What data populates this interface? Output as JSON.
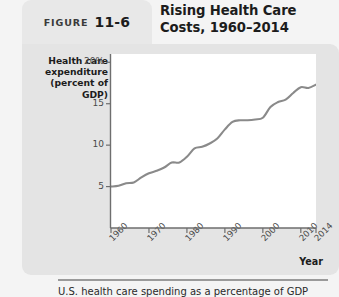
{
  "figure": {
    "label_word": "FIGURE",
    "number": "11-6",
    "title": "Rising Health Care Costs, 1960–2014",
    "caption": "U.S. health care spending as a percentage of GDP"
  },
  "colors": {
    "panel": "#e4e4e4",
    "tab": "#e8e8e8",
    "plot_background": "#ffffff",
    "line": "#8a8a8a",
    "axis": "#6e6e6e",
    "text": "#1c1c1c"
  },
  "chart_data": {
    "type": "line",
    "title": "Rising Health Care Costs, 1960–2014",
    "xlabel": "Year",
    "ylabel": "Health care expenditure (percent of GDP)",
    "ylabel_lines": [
      "Health care",
      "expenditure",
      "(percent of GDP)"
    ],
    "xlim": [
      1960,
      2014
    ],
    "ylim": [
      0,
      21
    ],
    "grid": false,
    "legend": "none",
    "y_ticks": [
      {
        "value": 20,
        "label": "20%"
      },
      {
        "value": 15,
        "label": "15"
      },
      {
        "value": 10,
        "label": "10"
      },
      {
        "value": 5,
        "label": "5"
      }
    ],
    "x_ticks": [
      {
        "value": 1960,
        "label": "1960"
      },
      {
        "value": 1970,
        "label": "1970"
      },
      {
        "value": 1980,
        "label": "1980"
      },
      {
        "value": 1990,
        "label": "1990"
      },
      {
        "value": 2000,
        "label": "2000"
      },
      {
        "value": 2010,
        "label": "2010"
      },
      {
        "value": 2014,
        "label": "2014"
      }
    ],
    "series": [
      {
        "name": "Health care expenditure (percent of GDP)",
        "color": "#8a8a8a",
        "x": [
          1960,
          1962,
          1964,
          1966,
          1968,
          1970,
          1972,
          1974,
          1976,
          1978,
          1980,
          1982,
          1984,
          1986,
          1988,
          1990,
          1992,
          1994,
          1996,
          1998,
          2000,
          2002,
          2004,
          2006,
          2008,
          2010,
          2012,
          2014
        ],
        "values": [
          5.0,
          5.1,
          5.4,
          5.5,
          6.1,
          6.6,
          6.9,
          7.3,
          7.9,
          7.9,
          8.6,
          9.6,
          9.8,
          10.2,
          10.8,
          11.9,
          12.8,
          13.0,
          13.0,
          13.1,
          13.3,
          14.6,
          15.2,
          15.5,
          16.3,
          17.0,
          16.9,
          17.3
        ]
      }
    ]
  }
}
